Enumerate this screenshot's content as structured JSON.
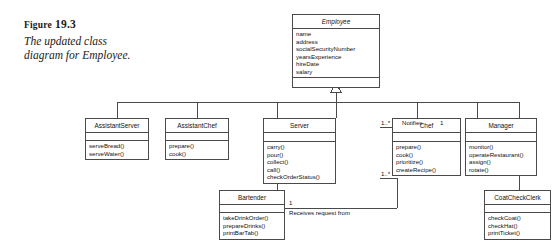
{
  "figure": {
    "label_prefix": "Figure",
    "label_number": "19.3",
    "caption": "The updated class diagram for Employee."
  },
  "diagram": {
    "type": "uml-class-diagram",
    "line_color": "#4a4a4a",
    "text_color": "#111111",
    "background": "#ffffff",
    "classes": [
      {
        "id": "employee",
        "name": "Employee",
        "abstract": true,
        "attributes": [
          "name",
          "address",
          "socialSecurityNumber",
          "yearsExperience",
          "hireDate",
          "salary"
        ],
        "operations": []
      },
      {
        "id": "assistant-server",
        "name": "AssistantServer",
        "abstract": false,
        "attributes": [],
        "operations": [
          "serveBread()",
          "serveWater()"
        ]
      },
      {
        "id": "assistant-chef",
        "name": "AssistantChef",
        "abstract": false,
        "attributes": [],
        "operations": [
          "prepare()",
          "cook()"
        ]
      },
      {
        "id": "server",
        "name": "Server",
        "abstract": false,
        "attributes": [],
        "operations": [
          "carry()",
          "pour()",
          "collect()",
          "call()",
          "checkOrderStatus()"
        ]
      },
      {
        "id": "chef",
        "name": "Chef",
        "abstract": false,
        "attributes": [],
        "operations": [
          "prepare()",
          "cook()",
          "prioritize()",
          "createRecipe()"
        ]
      },
      {
        "id": "manager",
        "name": "Manager",
        "abstract": false,
        "attributes": [],
        "operations": [
          "monitor()",
          "operateRestaurant()",
          "assign()",
          "rotate()"
        ]
      },
      {
        "id": "bartender",
        "name": "Bartender",
        "abstract": false,
        "attributes": [],
        "operations": [
          "takeDrinkOrder()",
          "prepareDrinks()",
          "printBarTab()"
        ]
      },
      {
        "id": "coat-check-clerk",
        "name": "CoatCheckClerk",
        "abstract": false,
        "attributes": [],
        "operations": [
          "checkCoat()",
          "checkHat()",
          "printTicket()"
        ]
      }
    ],
    "associations": [
      {
        "id": "server-notifies-chef",
        "label": "Notifies",
        "source": "server",
        "target": "chef",
        "source_multiplicity": "1..*",
        "target_multiplicity": "1"
      },
      {
        "id": "bartender-receives-request-from-server",
        "label": "Receives request from",
        "source": "server",
        "target": "bartender",
        "source_multiplicity": "1..*",
        "target_multiplicity": "1"
      }
    ],
    "generalizations": {
      "parent": "employee",
      "children": [
        "assistant-server",
        "assistant-chef",
        "bartender",
        "server",
        "chef",
        "manager",
        "coat-check-clerk"
      ]
    }
  }
}
